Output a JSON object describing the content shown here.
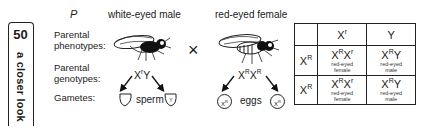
{
  "sidebar": {
    "page_number": "50",
    "title": "a closer look"
  },
  "diagram": {
    "generation_label": "P",
    "male_label": "white-eyed male",
    "female_label": "red-eyed female",
    "cross_symbol": "×",
    "row_labels": {
      "phenotypes_line1": "Parental",
      "phenotypes_line2": "phenotypes:",
      "genotypes_line1": "Parental",
      "genotypes_line2": "genotypes:",
      "gametes": "Gametes:"
    },
    "male_genotype": {
      "x": "X",
      "x_sup": "r",
      "y": "Y"
    },
    "female_genotype": {
      "x1": "X",
      "x1_sup": "R",
      "x2": "X",
      "x2_sup": "R"
    },
    "sperm_label": "sperm",
    "eggs_label": "eggs",
    "sperm_gametes": [
      {
        "base": "X",
        "sup": "r"
      },
      {
        "base": "Y",
        "sup": ""
      }
    ],
    "egg_gametes": [
      {
        "base": "X",
        "sup": "R"
      },
      {
        "base": "X",
        "sup": "R"
      }
    ]
  },
  "punnett": {
    "col_headers": [
      {
        "base": "X",
        "sup": "r"
      },
      {
        "base": "Y",
        "sup": ""
      }
    ],
    "rows": [
      {
        "header": {
          "base": "X",
          "sup": "R"
        },
        "cells": [
          {
            "g1": "X",
            "s1": "R",
            "g2": "X",
            "s2": "r",
            "pheno1": "red-eyed",
            "pheno2": "female"
          },
          {
            "g1": "X",
            "s1": "R",
            "g2": "Y",
            "s2": "",
            "pheno1": "red-eyed",
            "pheno2": "male"
          }
        ]
      },
      {
        "header": {
          "base": "X",
          "sup": "R"
        },
        "cells": [
          {
            "g1": "X",
            "s1": "R",
            "g2": "X",
            "s2": "r",
            "pheno1": "red-eyed",
            "pheno2": "female"
          },
          {
            "g1": "X",
            "s1": "R",
            "g2": "Y",
            "s2": "",
            "pheno1": "red-eyed",
            "pheno2": "male"
          }
        ]
      }
    ]
  }
}
